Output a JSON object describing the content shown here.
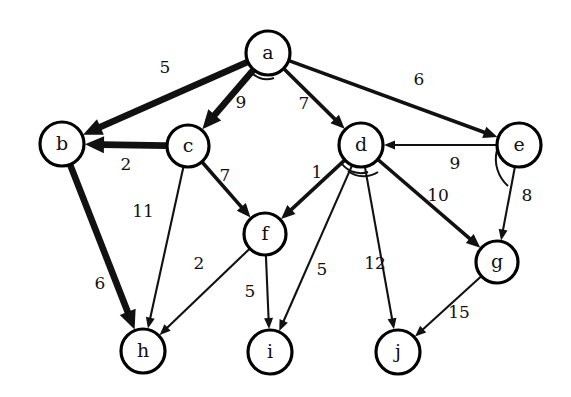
{
  "diagram": {
    "type": "directed-weighted-graph",
    "canvas": {
      "width": 571,
      "height": 397,
      "background": "#ffffff"
    },
    "ink_color": "#111111",
    "node_fill": "#ffffff",
    "nodes": [
      {
        "id": "a",
        "label": "a",
        "cx": 268,
        "cy": 53,
        "r": 22
      },
      {
        "id": "b",
        "label": "b",
        "cx": 62,
        "cy": 144,
        "r": 22
      },
      {
        "id": "c",
        "label": "c",
        "cx": 188,
        "cy": 146,
        "r": 21
      },
      {
        "id": "d",
        "label": "d",
        "cx": 361,
        "cy": 145,
        "r": 22
      },
      {
        "id": "e",
        "label": "e",
        "cx": 519,
        "cy": 145,
        "r": 22
      },
      {
        "id": "f",
        "label": "f",
        "cx": 265,
        "cy": 234,
        "r": 21
      },
      {
        "id": "g",
        "label": "g",
        "cx": 497,
        "cy": 262,
        "r": 21
      },
      {
        "id": "h",
        "label": "h",
        "cx": 143,
        "cy": 351,
        "r": 22
      },
      {
        "id": "i",
        "label": "i",
        "cx": 270,
        "cy": 352,
        "r": 22
      },
      {
        "id": "j",
        "label": "j",
        "cx": 398,
        "cy": 352,
        "r": 22
      }
    ],
    "edges": [
      {
        "from": "a",
        "to": "b",
        "weight": 5,
        "label_x": 165,
        "label_y": 68,
        "weight_style": "thick"
      },
      {
        "from": "a",
        "to": "c",
        "weight": 9,
        "label_x": 241,
        "label_y": 103,
        "weight_style": "thick"
      },
      {
        "from": "a",
        "to": "d",
        "weight": 7,
        "label_x": 304,
        "label_y": 104,
        "weight_style": "med"
      },
      {
        "from": "a",
        "to": "e",
        "weight": 6,
        "label_x": 419,
        "label_y": 80,
        "weight_style": "med"
      },
      {
        "from": "c",
        "to": "b",
        "weight": 2,
        "label_x": 126,
        "label_y": 165,
        "weight_style": "thick"
      },
      {
        "from": "c",
        "to": "f",
        "weight": 7,
        "label_x": 225,
        "label_y": 176,
        "weight_style": "med"
      },
      {
        "from": "c",
        "to": "h",
        "weight": 11,
        "label_x": 143,
        "label_y": 212,
        "weight_style": "thin"
      },
      {
        "from": "b",
        "to": "h",
        "weight": 6,
        "label_x": 100,
        "label_y": 284,
        "weight_style": "thick"
      },
      {
        "from": "d",
        "to": "f",
        "weight": 1,
        "label_x": 317,
        "label_y": 173,
        "weight_style": "med"
      },
      {
        "from": "d",
        "to": "i",
        "weight": 5,
        "label_x": 322,
        "label_y": 270,
        "weight_style": "thin"
      },
      {
        "from": "d",
        "to": "j",
        "weight": 12,
        "label_x": 375,
        "label_y": 264,
        "weight_style": "thin"
      },
      {
        "from": "d",
        "to": "g",
        "weight": 10,
        "label_x": 438,
        "label_y": 196,
        "weight_style": "med"
      },
      {
        "from": "e",
        "to": "d",
        "weight": 9,
        "label_x": 455,
        "label_y": 164,
        "weight_style": "thin"
      },
      {
        "from": "e",
        "to": "g",
        "weight": 8,
        "label_x": 527,
        "label_y": 196,
        "weight_style": "thin"
      },
      {
        "from": "f",
        "to": "h",
        "weight": 2,
        "label_x": 199,
        "label_y": 264,
        "weight_style": "thin"
      },
      {
        "from": "f",
        "to": "i",
        "weight": 5,
        "label_x": 250,
        "label_y": 292,
        "weight_style": "thin"
      },
      {
        "from": "g",
        "to": "j",
        "weight": 15,
        "label_x": 459,
        "label_y": 313,
        "weight_style": "thin"
      }
    ]
  }
}
